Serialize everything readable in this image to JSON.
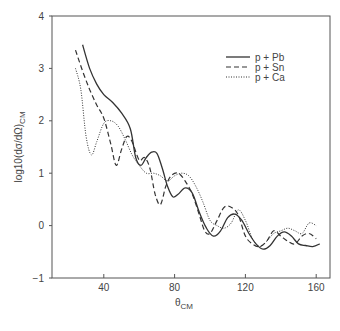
{
  "chart_data": {
    "type": "line",
    "title": "",
    "xlabel": "θ_CM",
    "xlabel_main": "θ",
    "xlabel_sub": "CM",
    "ylabel": "log10(dσ/dΩ)_CM",
    "ylabel_main": "log10(dσ/dΩ)",
    "ylabel_sub": "CM",
    "xlim": [
      10,
      170
    ],
    "ylim": [
      -1,
      4
    ],
    "xticks": [
      40,
      80,
      120,
      160
    ],
    "yticks": [
      -1,
      0,
      1,
      2,
      3,
      4
    ],
    "xtick_labels": [
      "40",
      "80",
      "120",
      "160"
    ],
    "ytick_labels": [
      "−1",
      "0",
      "1",
      "2",
      "3",
      "4"
    ],
    "grid": false,
    "legend_position": "upper right",
    "series": [
      {
        "name": "p + Pb",
        "style": "solid",
        "x": [
          28,
          32,
          36,
          40,
          45,
          50,
          55,
          58,
          61,
          64,
          67,
          70,
          73,
          76,
          79,
          82,
          86,
          90,
          94,
          98,
          102,
          106,
          110,
          114,
          118,
          122,
          126,
          130,
          134,
          138,
          142,
          146,
          150,
          154,
          158,
          162
        ],
        "y": [
          3.45,
          3.0,
          2.7,
          2.5,
          2.35,
          2.15,
          1.85,
          1.3,
          1.15,
          1.3,
          1.4,
          1.38,
          1.1,
          0.75,
          0.55,
          0.6,
          0.72,
          0.62,
          0.25,
          -0.05,
          -0.2,
          -0.1,
          0.15,
          0.22,
          0.1,
          -0.15,
          -0.35,
          -0.45,
          -0.38,
          -0.2,
          -0.12,
          -0.2,
          -0.35,
          -0.38,
          -0.4,
          -0.35
        ]
      },
      {
        "name": "p + Sn",
        "style": "dashed",
        "x": [
          24,
          28,
          32,
          36,
          40,
          44,
          47,
          50,
          53,
          56,
          60,
          63,
          66,
          69,
          72,
          75,
          78,
          82,
          86,
          90,
          94,
          97,
          100,
          104,
          108,
          112,
          116,
          120,
          124,
          128,
          132,
          136,
          140,
          144,
          148,
          152,
          156,
          160
        ],
        "y": [
          3.35,
          2.95,
          2.6,
          2.3,
          2.05,
          1.55,
          1.15,
          1.45,
          1.7,
          1.6,
          1.25,
          1.3,
          1.1,
          0.6,
          0.4,
          0.75,
          0.95,
          1.0,
          0.85,
          0.6,
          0.2,
          -0.1,
          -0.15,
          0.1,
          0.35,
          0.35,
          0.2,
          -0.2,
          -0.35,
          -0.4,
          -0.3,
          -0.1,
          -0.2,
          -0.3,
          -0.35,
          -0.2,
          -0.15,
          -0.25
        ]
      },
      {
        "name": "p + Ca",
        "style": "dotted",
        "x": [
          24,
          27,
          30,
          33,
          36,
          40,
          44,
          48,
          52,
          56,
          60,
          64,
          68,
          72,
          76,
          80,
          84,
          88,
          92,
          96,
          100,
          104,
          108,
          112,
          116,
          120,
          124,
          128,
          132,
          136,
          140,
          144,
          148,
          152,
          156,
          160
        ],
        "y": [
          3.0,
          2.6,
          1.7,
          1.35,
          1.6,
          1.95,
          2.0,
          1.9,
          1.65,
          1.35,
          1.15,
          1.0,
          1.0,
          0.95,
          0.85,
          0.95,
          1.0,
          0.95,
          0.75,
          0.45,
          0.1,
          0.0,
          -0.05,
          0.05,
          0.3,
          0.1,
          -0.25,
          -0.4,
          -0.3,
          -0.15,
          -0.1,
          -0.05,
          -0.1,
          -0.15,
          0.05,
          0.0
        ]
      }
    ]
  },
  "legend": {
    "items": [
      {
        "label": "p + Pb",
        "style": "solid"
      },
      {
        "label": "p + Sn",
        "style": "dashed"
      },
      {
        "label": "p + Ca",
        "style": "dotted"
      }
    ]
  }
}
